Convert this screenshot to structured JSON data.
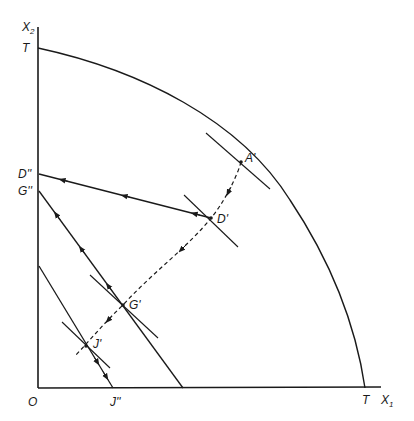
{
  "diagram": {
    "type": "production-possibility-frontier",
    "axes": {
      "x_label": "X",
      "x_subscript": "1",
      "y_label": "X",
      "y_subscript": "2",
      "origin_label": "O"
    },
    "frontier": {
      "y_intercept_label": "T",
      "x_intercept_label": "T"
    },
    "points": {
      "A": "A'",
      "D": "D'",
      "G": "G'",
      "J": "J'"
    },
    "intercepts": {
      "D_double": "D''",
      "G_double": "G''",
      "J_double": "J''"
    },
    "colors": {
      "line": "#1a1a1a",
      "background": "#ffffff"
    }
  }
}
